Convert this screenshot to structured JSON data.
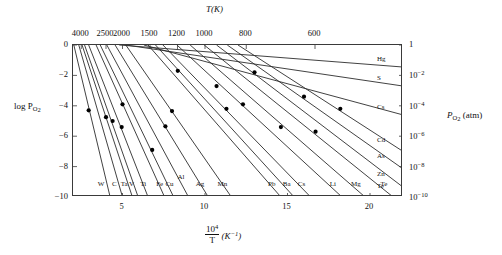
{
  "figure": {
    "top_axis_title": "T(K)",
    "left_axis_title_main": "log P",
    "left_axis_title_sub": "O",
    "left_axis_title_sub2": "2",
    "right_axis_title_main": "P",
    "right_axis_title_sub": "O",
    "right_axis_title_sub2": "2",
    "right_axis_title_unit": "(atm)",
    "x_axis_title_num": "10",
    "x_axis_title_num_sup": "4",
    "x_axis_title_den": "T",
    "x_axis_title_unit": "(K",
    "x_axis_title_unit_sup": "−1",
    "x_axis_title_unit_close": ")"
  },
  "chart_data": {
    "type": "line",
    "xlabel": "10^4/T (K^-1)",
    "ylabel": "log P_O2",
    "xlim": [
      2.0,
      22.0
    ],
    "ylim": [
      -10,
      0
    ],
    "grid": false,
    "legend": "inline-end-labels",
    "x_ticks": [
      5,
      10,
      15,
      20
    ],
    "x_tick_labels": [
      "5",
      "10",
      "15",
      "20"
    ],
    "y_ticks": [
      0,
      -2,
      -4,
      -6,
      -8,
      -10
    ],
    "y_tick_labels": [
      "0",
      "−2",
      "−4",
      "−6",
      "−8",
      "−10"
    ],
    "top_axis": {
      "label": "T(K)",
      "ticks_T": [
        4000,
        2500,
        2000,
        1500,
        1200,
        1000,
        800,
        600
      ],
      "tick_labels": [
        "4000",
        "2500",
        "2000",
        "1500",
        "1200",
        "1000",
        "800",
        "600"
      ],
      "tick_x_values": [
        2.5,
        4.0,
        5.0,
        6.667,
        8.333,
        10.0,
        12.5,
        16.667
      ]
    },
    "right_axis": {
      "label": "P_O2 (atm)",
      "ticks_log": [
        0,
        -2,
        -4,
        -6,
        -8,
        -10
      ],
      "tick_labels": [
        "1",
        "10−2",
        "10−4",
        "10−6",
        "10−8",
        "10−10"
      ],
      "tick_label_bases": [
        "1",
        "10",
        "10",
        "10",
        "10",
        "10"
      ],
      "tick_label_exps": [
        "",
        "−2",
        "−4",
        "−6",
        "−8",
        "−10"
      ]
    },
    "series": [
      {
        "name": "W",
        "label_side": "bottom",
        "x0": 2.05,
        "y0": 0.0,
        "x1": 4.25,
        "y1": -10.0,
        "point": {
          "x": 2.95,
          "y": -4.3
        }
      },
      {
        "name": "C",
        "label_side": "bottom",
        "x0": 2.35,
        "y0": 0.0,
        "x1": 5.0,
        "y1": -10.0,
        "point": null
      },
      {
        "name": "Ta",
        "label_side": "bottom",
        "x0": 2.55,
        "y0": 0.0,
        "x1": 5.6,
        "y1": -10.0,
        "point": {
          "x": 4.0,
          "y": -4.75
        }
      },
      {
        "name": "V",
        "label_side": "bottom",
        "x0": 2.7,
        "y0": 0.0,
        "x1": 5.95,
        "y1": -10.0,
        "point": {
          "x": 4.4,
          "y": -5.0
        }
      },
      {
        "name": "Ti",
        "label_side": "bottom",
        "x0": 2.95,
        "y0": 0.0,
        "x1": 6.55,
        "y1": -10.0,
        "point": {
          "x": 4.95,
          "y": -5.4
        }
      },
      {
        "name": "Fe",
        "label_side": "bottom",
        "x0": 3.4,
        "y0": 0.0,
        "x1": 7.55,
        "y1": -10.0,
        "point": {
          "x": 5.0,
          "y": -3.9
        }
      },
      {
        "name": "Cu",
        "label_side": "bottom",
        "x0": 3.65,
        "y0": 0.0,
        "x1": 8.1,
        "y1": -10.0,
        "point": {
          "x": 6.8,
          "y": -6.9
        }
      },
      {
        "name": "Al",
        "label_side": "bottom",
        "x0": 4.05,
        "y0": 0.0,
        "x1": 9.0,
        "y1": -10.0,
        "point": null
      },
      {
        "name": "Ag",
        "label_side": "bottom",
        "x0": 4.55,
        "y0": 0.0,
        "x1": 10.2,
        "y1": -10.0,
        "point": {
          "x": 7.6,
          "y": -5.35
        }
      },
      {
        "name": "Mn",
        "label_side": "bottom",
        "x0": 5.2,
        "y0": 0.0,
        "x1": 11.6,
        "y1": -10.0,
        "point": {
          "x": 8.0,
          "y": -4.35
        }
      },
      {
        "name": "Pb",
        "label_side": "bottom",
        "x0": 6.55,
        "y0": 0.0,
        "x1": 14.6,
        "y1": -10.0,
        "point": {
          "x": 10.7,
          "y": -2.7
        }
      },
      {
        "name": "Ba",
        "label_side": "bottom",
        "x0": 7.0,
        "y0": 0.0,
        "x1": 15.4,
        "y1": -10.0,
        "point": {
          "x": 8.35,
          "y": -1.7
        }
      },
      {
        "name": "Cs",
        "label_side": "bottom",
        "x0": 7.45,
        "y0": 0.0,
        "x1": 16.4,
        "y1": -10.0,
        "point": {
          "x": 11.3,
          "y": -4.2
        }
      },
      {
        "name": "Li",
        "label_side": "bottom",
        "x0": 8.3,
        "y0": 0.0,
        "x1": 18.3,
        "y1": -10.0,
        "point": {
          "x": 12.3,
          "y": -3.9
        }
      },
      {
        "name": "Mg",
        "label_side": "bottom",
        "x0": 9.1,
        "y0": 0.0,
        "x1": 19.7,
        "y1": -10.0,
        "point": {
          "x": 14.6,
          "y": -5.4
        }
      },
      {
        "name": "Te",
        "label_side": "bottom",
        "x0": 9.95,
        "y0": 0.0,
        "x1": 21.4,
        "y1": -10.0,
        "point": {
          "x": 16.7,
          "y": -5.7
        }
      },
      {
        "name": "Zn",
        "label_side": "right",
        "x0": 10.7,
        "y0": 0.0,
        "x1": 22.0,
        "y1": -9.35,
        "point": {
          "x": 13.0,
          "y": -1.8
        }
      },
      {
        "name": "As",
        "label_side": "right",
        "x0": 11.35,
        "y0": 0.0,
        "x1": 22.0,
        "y1": -8.15,
        "point": {
          "x": 16.0,
          "y": -3.4
        }
      },
      {
        "name": "Cd",
        "label_side": "right",
        "x0": 12.0,
        "y0": 0.0,
        "x1": 22.0,
        "y1": -7.0,
        "point": {
          "x": 18.2,
          "y": -4.2
        }
      },
      {
        "name": "Cs",
        "label_side": "right",
        "x0": 6.3,
        "y0": 0.0,
        "x1": 22.0,
        "y1": -4.6,
        "point": null
      },
      {
        "name": "S",
        "label_side": "right",
        "x0": 5.2,
        "y0": 0.0,
        "x1": 22.0,
        "y1": -2.7,
        "point": null
      },
      {
        "name": "Hg",
        "label_side": "right",
        "x0": 4.8,
        "y0": 0.0,
        "x1": 22.0,
        "y1": -1.45,
        "point": null
      }
    ],
    "bottom_series_labels": [
      {
        "name": "W",
        "x": 3.7,
        "y_px_offset": 0
      },
      {
        "name": "C",
        "x": 4.5,
        "y_px_offset": 0
      },
      {
        "name": "Ta",
        "x": 5.1,
        "y_px_offset": 0
      },
      {
        "name": "V",
        "x": 5.55,
        "y_px_offset": 0
      },
      {
        "name": "Ti",
        "x": 6.25,
        "y_px_offset": 0
      },
      {
        "name": "Fe",
        "x": 7.25,
        "y_px_offset": 0
      },
      {
        "name": "Cu",
        "x": 7.85,
        "y_px_offset": 0
      },
      {
        "name": "Al",
        "x": 8.55,
        "y_px_offset": -7
      },
      {
        "name": "Ag",
        "x": 9.7,
        "y_px_offset": 0
      },
      {
        "name": "Mn",
        "x": 11.05,
        "y_px_offset": 0
      },
      {
        "name": "Pb",
        "x": 14.05,
        "y_px_offset": 0
      },
      {
        "name": "Ba",
        "x": 14.95,
        "y_px_offset": 0
      },
      {
        "name": "Cs",
        "x": 15.85,
        "y_px_offset": 0
      },
      {
        "name": "Li",
        "x": 17.75,
        "y_px_offset": 0
      },
      {
        "name": "Mg",
        "x": 19.15,
        "y_px_offset": 0
      },
      {
        "name": "Te",
        "x": 20.85,
        "y_px_offset": 0
      }
    ],
    "right_series_labels": [
      {
        "name": "Hg",
        "y": -1.0
      },
      {
        "name": "S",
        "y": -2.25
      },
      {
        "name": "Cs",
        "y": -4.15
      },
      {
        "name": "Cd",
        "y": -6.3
      },
      {
        "name": "As",
        "y": -7.35
      },
      {
        "name": "Zn",
        "y": -8.55
      },
      {
        "name": "Te",
        "y": -9.35
      }
    ],
    "line_color": "#2c2c2c",
    "marker_color": "#000000",
    "axis_color": "#3a3a3a"
  }
}
